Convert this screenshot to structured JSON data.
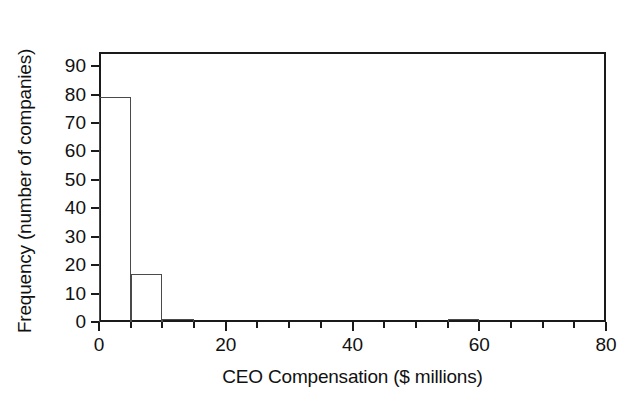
{
  "chart_data": {
    "type": "bar",
    "subtype": "histogram",
    "title": "",
    "xlabel": "CEO Compensation ($ millions)",
    "ylabel": "Frequency (number of companies)",
    "xlim": [
      0,
      80
    ],
    "ylim": [
      0,
      95
    ],
    "bin_width": 5,
    "xticks": [
      0,
      20,
      40,
      60,
      80
    ],
    "xtick_labels": [
      "0",
      "20",
      "40",
      "60",
      "80"
    ],
    "xticks_minor": [
      5,
      10,
      15,
      25,
      30,
      35,
      45,
      50,
      55,
      65,
      70,
      75
    ],
    "yticks": [
      0,
      10,
      20,
      30,
      40,
      50,
      60,
      70,
      80,
      90
    ],
    "ytick_labels": [
      "0",
      "10",
      "20",
      "30",
      "40",
      "50",
      "60",
      "70",
      "80",
      "90"
    ],
    "grid": false,
    "legend": null,
    "bin_edges": [
      0,
      5,
      10,
      15,
      20,
      25,
      30,
      35,
      40,
      45,
      50,
      55,
      60,
      65,
      70,
      75,
      80
    ],
    "categories": [
      "0-5",
      "5-10",
      "10-15",
      "15-20",
      "20-25",
      "25-30",
      "30-35",
      "35-40",
      "40-45",
      "45-50",
      "50-55",
      "55-60",
      "60-65",
      "65-70",
      "70-75",
      "75-80"
    ],
    "values": [
      79,
      17,
      1,
      0,
      0,
      0,
      0,
      0,
      0,
      0,
      0,
      1,
      0,
      0,
      0,
      0
    ],
    "bars": [
      {
        "x0": 0,
        "x1": 5,
        "value": 79
      },
      {
        "x0": 5,
        "x1": 10,
        "value": 17
      },
      {
        "x0": 10,
        "x1": 15,
        "value": 1
      },
      {
        "x0": 55,
        "x1": 60,
        "value": 1
      }
    ],
    "colors": {
      "bar_stroke": "#4a4a4a",
      "bar_fill": "none",
      "axis": "#1a1a1a",
      "text": "#111111",
      "background": "#ffffff"
    }
  }
}
